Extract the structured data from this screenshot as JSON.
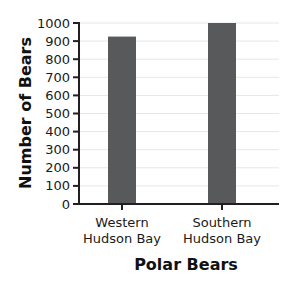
{
  "chart_data": {
    "type": "bar",
    "title": "",
    "xlabel": "Polar Bears",
    "ylabel": "Number of Bears",
    "categories": [
      [
        "Western",
        "Hudson Bay"
      ],
      [
        "Southern",
        "Hudson Bay"
      ]
    ],
    "values": [
      925,
      1000
    ],
    "ylim": [
      0,
      1000
    ],
    "yticks": [
      0,
      100,
      200,
      300,
      400,
      500,
      600,
      700,
      800,
      900,
      1000
    ],
    "grid": true,
    "legend": "none",
    "colors": {
      "bar": "#58595b",
      "grid": "#e6e6e6",
      "axis": "#231f20"
    }
  }
}
